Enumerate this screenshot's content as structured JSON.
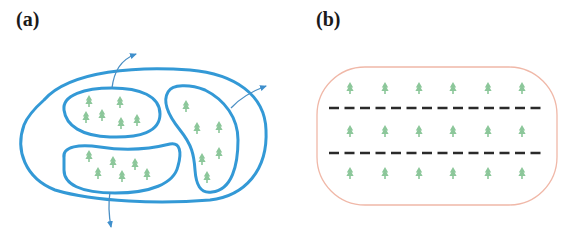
{
  "figure": {
    "panels": [
      {
        "id": "a",
        "label": "(a)",
        "description": "Large blue closed loop enclosing three smaller blue loops (patches) containing green tree/plant symbols; arrows leave the loops outward",
        "outer_loop_color": "#3399d6",
        "patches": [
          {
            "name": "top-left-patch",
            "tree_count": 6
          },
          {
            "name": "bottom-left-patch",
            "tree_count": 6
          },
          {
            "name": "right-patch",
            "tree_count": 6
          }
        ],
        "arrows": 3
      },
      {
        "id": "b",
        "label": "(b)",
        "description": "Pale salmon rounded boundary containing three rows of green tree symbols separated by two black dashed lines",
        "boundary_color": "#f0b8a8",
        "dash_color": "#2a2a2a",
        "rows": 3,
        "trees_per_row": 6,
        "dashed_lines": 2
      }
    ],
    "colors": {
      "loop_blue": "#3399d6",
      "arrow_blue": "#4a8fc4",
      "tree_green": "#8cc79a",
      "boundary_salmon": "#f0b8a8",
      "dash_black": "#2a2a2a"
    }
  }
}
